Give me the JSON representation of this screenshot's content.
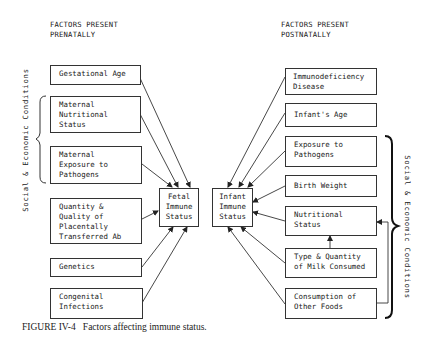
{
  "headers": {
    "left": "FACTORS PRESENT\nPRENATALLY",
    "right": "FACTORS PRESENT\nPOSTNATALLY"
  },
  "prenatal_factors": [
    "Gestational Age",
    "Maternal\nNutritional\nStatus",
    "Maternal\nExposure to\nPathogens",
    "Quantity &\nQuality of\nPlacentally\nTransferred Ab",
    "Genetics",
    "Congenital\nInfections"
  ],
  "center": {
    "fetal": "Fetal\nImmune\nStatus",
    "infant": "Infant\nImmune\nStatus"
  },
  "postnatal_factors": [
    "Immunodeficiency\nDisease",
    "Infant's Age",
    "Exposure to\nPathogens",
    "Birth Weight",
    "Nutritional\nStatus",
    "Type & Quantity\nof Milk Consumed",
    "Consumption of\nOther Foods"
  ],
  "brace_labels": {
    "left": "Social & Economic Conditions",
    "right": "Social & Economic Conditions"
  },
  "caption": "FIGURE IV-4   Factors affecting immune status."
}
